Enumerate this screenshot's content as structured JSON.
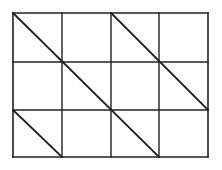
{
  "figure": {
    "kind": "geometric-line-diagram",
    "canvas": {
      "width": 222,
      "height": 170,
      "background_color": "#ffffff"
    },
    "stroke": {
      "color": "#231f20",
      "grid_width": 1.4,
      "border_width": 1.6,
      "diagonal_width": 1.9,
      "linecap": "square"
    },
    "grid": {
      "x_lines": [
        13,
        62,
        111,
        159,
        208
      ],
      "y_lines": [
        13,
        62,
        110,
        157
      ],
      "columns": 4,
      "rows": 3,
      "cell_width": 48.75,
      "cell_height": 48
    },
    "border": {
      "left": 13,
      "top": 13,
      "right": 208,
      "bottom": 157,
      "width": 195,
      "height": 144
    },
    "segments": [
      {
        "name": "border-top",
        "x1": 13,
        "y1": 13,
        "x2": 208,
        "y2": 13,
        "role": "border"
      },
      {
        "name": "border-bottom",
        "x1": 13,
        "y1": 157,
        "x2": 208,
        "y2": 157,
        "role": "border"
      },
      {
        "name": "border-left",
        "x1": 13,
        "y1": 13,
        "x2": 13,
        "y2": 157,
        "role": "border"
      },
      {
        "name": "border-right",
        "x1": 208,
        "y1": 13,
        "x2": 208,
        "y2": 157,
        "role": "border"
      },
      {
        "name": "grid-vertical-1",
        "x1": 62,
        "y1": 13,
        "x2": 62,
        "y2": 157,
        "role": "grid"
      },
      {
        "name": "grid-vertical-2",
        "x1": 111,
        "y1": 13,
        "x2": 111,
        "y2": 157,
        "role": "grid"
      },
      {
        "name": "grid-vertical-3",
        "x1": 159,
        "y1": 13,
        "x2": 159,
        "y2": 157,
        "role": "grid"
      },
      {
        "name": "grid-horizontal-1",
        "x1": 13,
        "y1": 62,
        "x2": 208,
        "y2": 62,
        "role": "grid"
      },
      {
        "name": "grid-horizontal-2",
        "x1": 13,
        "y1": 110,
        "x2": 208,
        "y2": 110,
        "role": "grid"
      },
      {
        "name": "diagonal-long-main",
        "x1": 13,
        "y1": 13,
        "x2": 159,
        "y2": 157,
        "role": "diagonal",
        "cells_spanned": 3
      },
      {
        "name": "diagonal-upper-right",
        "x1": 111,
        "y1": 13,
        "x2": 208,
        "y2": 110,
        "role": "diagonal",
        "cells_spanned": 2
      },
      {
        "name": "diagonal-lower-left",
        "x1": 13,
        "y1": 110,
        "x2": 62,
        "y2": 157,
        "role": "diagonal",
        "cells_spanned": 1
      }
    ]
  }
}
